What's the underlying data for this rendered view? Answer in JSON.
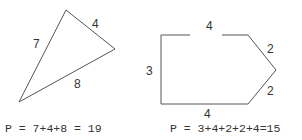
{
  "triangle": {
    "sides": {
      "left": "7",
      "top_right": "4",
      "bottom": "8"
    },
    "formula": "P = 7+4+8 = 19"
  },
  "pentagon": {
    "sides": {
      "left": "3",
      "top": "4",
      "upper_right": "2",
      "lower_right": "2",
      "bottom": "4"
    },
    "formula": "P = 3+4+2+2+4=15"
  },
  "colors": {
    "stroke": "#555555",
    "text": "#333333"
  }
}
